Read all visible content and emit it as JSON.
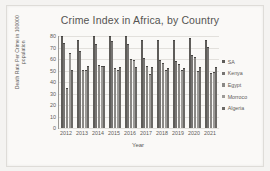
{
  "chart_data": {
    "type": "bar",
    "title": "Crime Index in  Africa, by  Country",
    "xlabel": "Year",
    "ylabel": "Death Rate Per Crime in 100000 population",
    "grid": true,
    "legend_position": "right",
    "ylim": [
      0,
      80
    ],
    "yticks": [
      0,
      10,
      20,
      30,
      40,
      50,
      60,
      70,
      80
    ],
    "categories": [
      "2012",
      "2013",
      "2014",
      "2015",
      "2016",
      "2017",
      "2018",
      "2019",
      "2020",
      "2021"
    ],
    "series": [
      {
        "name": "SA",
        "color": "#5e5c59",
        "values": [
          79,
          76,
          79,
          79,
          79,
          76,
          76,
          76,
          77,
          76
        ]
      },
      {
        "name": "Kenya",
        "color": "#767472",
        "values": [
          73,
          66,
          72,
          75,
          72,
          60,
          58,
          57,
          63,
          70
        ]
      },
      {
        "name": "Egypt",
        "color": "#8a8885",
        "values": [
          34,
          50,
          54,
          51,
          59,
          53,
          56,
          55,
          61,
          47
        ]
      },
      {
        "name": "Morroco",
        "color": "#9c9a97",
        "values": [
          64,
          50,
          53,
          50,
          58,
          46,
          50,
          50,
          49,
          48
        ]
      },
      {
        "name": "Algeria",
        "color": "#6b6966",
        "values": [
          50,
          53,
          53,
          52,
          52,
          52,
          51,
          51,
          52,
          52
        ]
      }
    ]
  },
  "legend": {
    "items": [
      {
        "label": "SA"
      },
      {
        "label": "Kenya"
      },
      {
        "label": "Egypt"
      },
      {
        "label": "Morroco"
      },
      {
        "label": "Algeria"
      }
    ]
  }
}
